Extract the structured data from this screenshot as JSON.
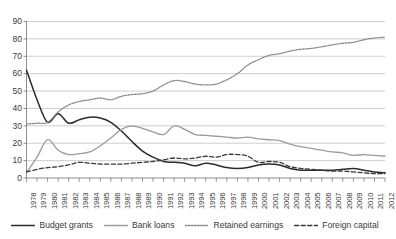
{
  "chart_data": {
    "type": "line",
    "title": "",
    "xlabel": "",
    "ylabel": "",
    "ylim": [
      0,
      90
    ],
    "ytick_step": 10,
    "grid": true,
    "legend_position": "bottom",
    "yticks": [
      "0",
      "10",
      "20",
      "30",
      "40",
      "50",
      "60",
      "70",
      "80",
      "90"
    ],
    "categories": [
      "1978",
      "1979",
      "1980",
      "1981",
      "1982",
      "1983",
      "1984",
      "1985",
      "1986",
      "1987",
      "1988",
      "1989",
      "1990",
      "1991",
      "1992",
      "1993",
      "1994",
      "1995",
      "1996",
      "1997",
      "1998",
      "1999",
      "2000",
      "2001",
      "2002",
      "2003",
      "2004",
      "2005",
      "2006",
      "2007",
      "2008",
      "2009",
      "2010",
      "2011",
      "2012"
    ],
    "series": [
      {
        "name": "Budget grants",
        "style": "solid",
        "color": "#2b2b2b",
        "width": 1.5,
        "values": [
          62.0,
          45.0,
          32.0,
          37.0,
          31.5,
          33.5,
          35.0,
          34.5,
          32.0,
          27.0,
          21.0,
          15.5,
          12.0,
          9.5,
          9.0,
          8.5,
          7.0,
          8.5,
          7.5,
          6.0,
          5.5,
          6.0,
          7.5,
          8.0,
          7.5,
          5.5,
          4.5,
          4.5,
          4.5,
          4.5,
          5.0,
          5.5,
          4.5,
          3.5,
          3.0
        ]
      },
      {
        "name": "Bank loans",
        "style": "solid",
        "color": "#9b9b9b",
        "width": 1.3,
        "values": [
          3.0,
          12.0,
          22.0,
          16.0,
          13.5,
          14.0,
          15.0,
          18.5,
          23.0,
          28.0,
          30.0,
          28.5,
          26.5,
          25.0,
          30.0,
          28.0,
          25.0,
          24.5,
          24.0,
          23.5,
          23.0,
          23.5,
          22.5,
          22.0,
          21.5,
          19.5,
          18.0,
          17.0,
          16.0,
          15.0,
          14.5,
          13.0,
          13.5,
          13.0,
          12.5
        ]
      },
      {
        "name": "Retained earnings",
        "style": "dotted",
        "color": "#8a8a8a",
        "width": 1.3,
        "values": [
          31.0,
          31.5,
          32.0,
          38.0,
          42.0,
          44.0,
          45.0,
          46.0,
          45.0,
          47.0,
          48.0,
          48.5,
          50.0,
          53.5,
          56.0,
          55.5,
          54.0,
          53.5,
          54.0,
          56.5,
          60.0,
          65.0,
          68.0,
          70.5,
          71.5,
          73.0,
          74.0,
          74.5,
          75.5,
          76.5,
          77.5,
          78.0,
          79.5,
          80.5,
          81.0
        ]
      },
      {
        "name": "Foreign capital",
        "style": "dashed",
        "color": "#3a3a3a",
        "width": 1.3,
        "values": [
          3.5,
          5.0,
          6.0,
          6.5,
          7.5,
          9.0,
          8.5,
          8.0,
          8.0,
          8.0,
          8.5,
          9.0,
          9.5,
          10.5,
          11.5,
          11.0,
          11.5,
          12.5,
          12.0,
          13.5,
          13.5,
          12.5,
          9.0,
          9.5,
          9.0,
          6.5,
          5.5,
          5.0,
          4.5,
          4.0,
          4.0,
          3.5,
          3.0,
          2.5,
          2.5
        ]
      }
    ]
  },
  "legend": {
    "items": [
      {
        "label": "Budget grants",
        "swatch": "line-solid-dark-swatch"
      },
      {
        "label": "Bank loans",
        "swatch": "line-solid-gray-swatch"
      },
      {
        "label": "Retained earnings",
        "swatch": "line-dotted-swatch"
      },
      {
        "label": "Foreign capital",
        "swatch": "line-dashed-swatch"
      }
    ]
  },
  "colors": {
    "budget_grants": "#2b2b2b",
    "bank_loans": "#9b9b9b",
    "retained_earnings": "#8a8a8a",
    "foreign_capital": "#3a3a3a",
    "grid": "#b9b9b9",
    "axis": "#808080",
    "text": "#3a3a3a"
  }
}
